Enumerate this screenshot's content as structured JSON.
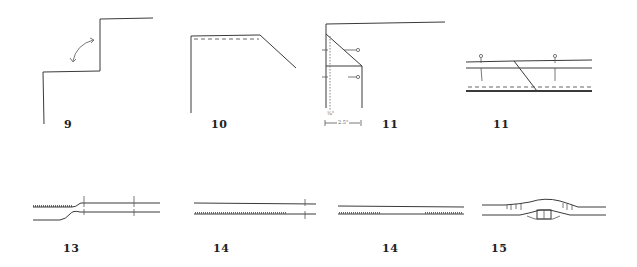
{
  "figures": [
    {
      "id": "step-9",
      "label": "9",
      "description": "Stepped corner with curved rotation arrow"
    },
    {
      "id": "step-10",
      "label": "10",
      "description": "Angled corner with dashed stitch line"
    },
    {
      "id": "step-11a",
      "label": "11",
      "description": "Corner with seam allowance and pins",
      "annotations": {
        "seam_allowance": "¾\"",
        "width": "2.5\""
      }
    },
    {
      "id": "step-11b",
      "label": "11",
      "description": "Diagonal seam across strips with pins"
    },
    {
      "id": "step-13",
      "label": "13",
      "description": "Strip edge tapering with marks"
    },
    {
      "id": "step-14a",
      "label": "14",
      "description": "Two parallel strips with stitching"
    },
    {
      "id": "step-14b",
      "label": "14",
      "description": "Two parallel strips with partial stitching"
    },
    {
      "id": "step-15",
      "label": "15",
      "description": "Gathered join with folded insert"
    }
  ]
}
